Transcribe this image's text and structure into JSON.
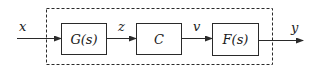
{
  "diagram": {
    "type": "block-diagram",
    "input": {
      "label": "x"
    },
    "output": {
      "label": "y"
    },
    "blocks": [
      {
        "id": "G",
        "label": "G(s)"
      },
      {
        "id": "C",
        "label": "C"
      },
      {
        "id": "F",
        "label": "F(s)"
      }
    ],
    "signals": [
      {
        "label": "x",
        "from": "input",
        "to": "G"
      },
      {
        "label": "z",
        "from": "G",
        "to": "C"
      },
      {
        "label": "v",
        "from": "C",
        "to": "F"
      },
      {
        "label": "y",
        "from": "F",
        "to": "output"
      }
    ],
    "enclosure": {
      "style": "dashed",
      "contains": [
        "G",
        "C",
        "F"
      ]
    },
    "colors": {
      "stroke": "#2a2a2a",
      "background": "#ffffff"
    }
  }
}
